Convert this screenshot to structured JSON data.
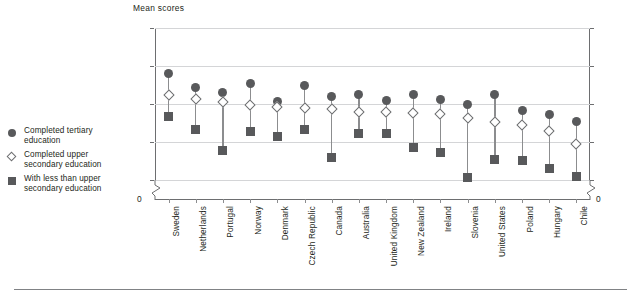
{
  "axis_title": "Mean scores",
  "legend": [
    {
      "marker": "filled-circle-icon",
      "label": "Completed tertiary\neducation"
    },
    {
      "marker": "open-diamond-icon",
      "label": "Completed upper\nsecondary education"
    },
    {
      "marker": "filled-square-icon",
      "label": "With less than upper\nsecondary education"
    }
  ],
  "y_ticks": [
    "400",
    "350",
    "300",
    "250",
    "200"
  ],
  "zero_label": "0",
  "colors": {
    "marker_fill": "#58595b",
    "marker_outline": "#6d6e70",
    "stem": "#8c8d8f",
    "gridline": "#d4d5d7",
    "axis": "#6d6e70",
    "text": "#231f20"
  },
  "chart_data": {
    "type": "scatter",
    "title": "Mean scores",
    "xlabel": "",
    "ylabel": "Mean scores",
    "ylim": [
      200,
      400
    ],
    "yticks": [
      200,
      250,
      300,
      350,
      400
    ],
    "grid": true,
    "legend_position": "left",
    "axis_break": "between 0 and 200",
    "categories": [
      "Sweden",
      "Netherlands",
      "Portugal",
      "Norway",
      "Denmark",
      "Czech Republic",
      "Canada",
      "Australia",
      "United Kingdom",
      "New Zealand",
      "Ireland",
      "Slovenia",
      "United States",
      "Poland",
      "Hungary",
      "Chile"
    ],
    "series": [
      {
        "name": "Completed tertiary education",
        "marker": "filled-circle",
        "values": [
          340,
          322,
          315,
          327,
          303,
          324,
          310,
          313,
          304,
          313,
          306,
          300,
          313,
          291,
          286,
          277
        ]
      },
      {
        "name": "Completed upper secondary education",
        "marker": "open-diamond",
        "values": [
          312,
          307,
          302,
          299,
          296,
          295,
          294,
          290,
          289,
          288,
          287,
          281,
          276,
          273,
          265,
          248
        ]
      },
      {
        "name": "With less than upper secondary education",
        "marker": "filled-square",
        "values": [
          283,
          266,
          239,
          264,
          257,
          267,
          230,
          261,
          261,
          243,
          236,
          203,
          227,
          226,
          215,
          205
        ]
      }
    ]
  }
}
